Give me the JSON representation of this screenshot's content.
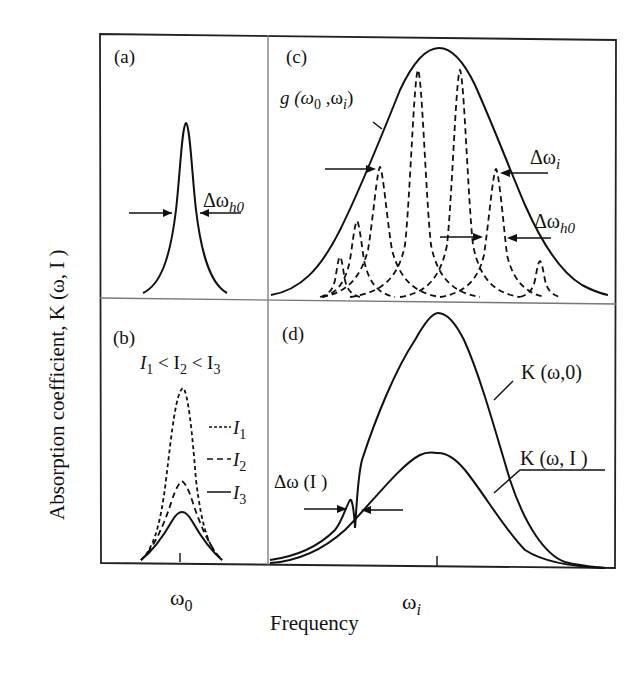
{
  "figure": {
    "y_axis_label": "Absorption coefficient, K (ω, I )",
    "x_axis_label": "Frequency",
    "x_tick_left": "ω",
    "x_tick_left_sub": "0",
    "x_tick_right": "ω",
    "x_tick_right_sub": "i"
  },
  "panels": {
    "a": {
      "label": "(a)",
      "width_label": "Δω",
      "width_label_sub": "h0"
    },
    "b": {
      "label": "(b)",
      "relation": [
        "I",
        "1",
        " < I",
        "2",
        " < I",
        "3"
      ],
      "legend": [
        {
          "style": "dotted-dash",
          "name": "I",
          "sub": "1"
        },
        {
          "style": "long-dash",
          "name": "I",
          "sub": "2"
        },
        {
          "style": "solid",
          "name": "I",
          "sub": "3"
        }
      ]
    },
    "c": {
      "label": "(c)",
      "envelope_label": "g (ω",
      "envelope_label_sub1": "0",
      "envelope_label_mid": " ,ω",
      "envelope_label_sub2": "i",
      "envelope_label_end": ")",
      "inhomog_width_label": "Δω",
      "inhomog_width_sub": "i",
      "homog_width_label": "Δω",
      "homog_width_sub": "h0"
    },
    "d": {
      "label": "(d)",
      "curve_unsaturated": "K (ω,0)",
      "curve_saturated": "K (ω, I )",
      "hole_width_label": "Δω (I )"
    }
  }
}
